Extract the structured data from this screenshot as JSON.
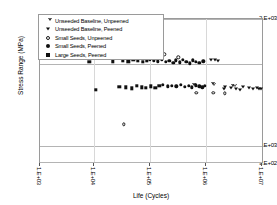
{
  "chart_data": {
    "type": "scatter",
    "title": "",
    "xlabel": "Life (Cycles)",
    "ylabel": "Stress Range (MPa)",
    "xscale": "log",
    "yscale": "log",
    "xlim": [
      1000,
      10000000
    ],
    "ylim": [
      900,
      2000
    ],
    "xticks": [
      "1.E+03",
      "1.E+04",
      "1.E+05",
      "1.E+06",
      "1.E+07"
    ],
    "xtick_values": [
      1000,
      10000,
      100000,
      1000000,
      10000000
    ],
    "yticks": [
      "2.E+03",
      "1.E+03",
      "9.E+02"
    ],
    "ytick_values": [
      2000,
      1000,
      900
    ],
    "grid": "horizontal-at-yticks",
    "legend_position": "upper-left-inside",
    "series": [
      {
        "name": "Unseeded Baseline, Unpeened",
        "marker": "triangle-down-open",
        "points": [
          [
            520000,
            1385
          ],
          [
            1020000,
            1382
          ],
          [
            1850000,
            1378
          ],
          [
            690000,
            1390
          ],
          [
            1450000,
            1372
          ]
        ]
      },
      {
        "name": "Unseeded Baseline, Peened",
        "marker": "triangle-down-filled",
        "points": [
          [
            1150000,
            1600
          ],
          [
            1320000,
            1596
          ],
          [
            1500000,
            1588
          ],
          [
            2600000,
            1368
          ],
          [
            3200000,
            1362
          ],
          [
            4300000,
            1372
          ],
          [
            5400000,
            1366
          ],
          [
            6400000,
            1358
          ],
          [
            7600000,
            1370
          ],
          [
            9000000,
            1360
          ],
          [
            2050000,
            1376
          ],
          [
            3700000,
            1356
          ],
          [
            8200000,
            1364
          ],
          [
            1950000,
            1364
          ]
        ]
      },
      {
        "name": "Small Seeds, Unpeened",
        "marker": "circle-open",
        "points": [
          [
            13500,
            1640
          ],
          [
            165000,
            1648
          ],
          [
            295000,
            1620
          ],
          [
            620000,
            1332
          ],
          [
            1250000,
            1330
          ],
          [
            2000000,
            1328
          ],
          [
            31000,
            1120
          ]
        ]
      },
      {
        "name": "Small Seeds, Peened",
        "marker": "circle-filled",
        "points": [
          [
            92000,
            1600
          ],
          [
            108000,
            1592
          ],
          [
            126000,
            1586
          ],
          [
            150000,
            1598
          ],
          [
            178000,
            1578
          ],
          [
            205000,
            1588
          ],
          [
            240000,
            1570
          ],
          [
            268000,
            1592
          ],
          [
            310000,
            1576
          ],
          [
            355000,
            1600
          ],
          [
            410000,
            1582
          ],
          [
            470000,
            1566
          ],
          [
            540000,
            1594
          ],
          [
            600000,
            1580
          ],
          [
            700000,
            1572
          ],
          [
            820000,
            1586
          ],
          [
            155000,
            1390
          ],
          [
            190000,
            1382
          ],
          [
            225000,
            1386
          ],
          [
            270000,
            1380
          ],
          [
            330000,
            1392
          ],
          [
            390000,
            1378
          ],
          [
            450000,
            1384
          ],
          [
            520000,
            1374
          ],
          [
            600000,
            1388
          ],
          [
            700000,
            1380
          ],
          [
            790000,
            1372
          ],
          [
            880000,
            1384
          ]
        ]
      },
      {
        "name": "Large Seeds, Peened",
        "marker": "square-filled",
        "points": [
          [
            7600,
            1580
          ],
          [
            20000,
            1586
          ],
          [
            30000,
            1592
          ],
          [
            38000,
            1584
          ],
          [
            46000,
            1596
          ],
          [
            56000,
            1588
          ],
          [
            68000,
            1578
          ],
          [
            80000,
            1590
          ],
          [
            9800,
            1352
          ],
          [
            26000,
            1378
          ],
          [
            34000,
            1372
          ],
          [
            44000,
            1366
          ],
          [
            54000,
            1384
          ],
          [
            66000,
            1374
          ],
          [
            78000,
            1368
          ],
          [
            96000,
            1380
          ],
          [
            115000,
            1370
          ],
          [
            135000,
            1386
          ]
        ]
      }
    ]
  },
  "axes": {
    "ylabel": "Stress Range (MPa)",
    "xlabel": "Life (Cycles)",
    "yticks": [
      {
        "label": "2.E+03"
      },
      {
        "label": "1.E+03"
      },
      {
        "label": "9.E+02"
      }
    ],
    "xticks": [
      {
        "label": "1.E+03"
      },
      {
        "label": "1.E+04"
      },
      {
        "label": "1.E+05"
      },
      {
        "label": "1.E+06"
      },
      {
        "label": "1.E+07"
      }
    ]
  },
  "legend": {
    "items": [
      {
        "label": "Unseeded Baseline, Unpeened",
        "marker": "triangle-down-open"
      },
      {
        "label": "Unseeded Baseline, Peened",
        "marker": "triangle-down-filled"
      },
      {
        "label": "Small Seeds, Unpeened",
        "marker": "circle-open"
      },
      {
        "label": "Small Seeds, Peened",
        "marker": "circle-filled"
      },
      {
        "label": "Large Seeds, Peened",
        "marker": "square-filled"
      }
    ]
  },
  "colors": {
    "marker": "#101010",
    "frame": "#9a9a9a",
    "grid": "#b4b4b4",
    "background": "#ffffff"
  }
}
